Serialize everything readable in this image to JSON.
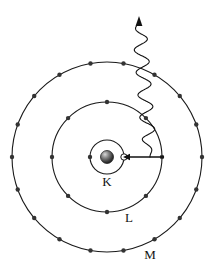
{
  "figure": {
    "background_color": "#ffffff",
    "stroke_color": "#1a1a1a",
    "electron_color": "#333333",
    "width": 213,
    "height": 270
  },
  "atom": {
    "center": {
      "x": 107,
      "y": 157
    },
    "nucleus": {
      "label": "nucleus",
      "radius": 6.5,
      "fill_color": "#555555",
      "highlight_color": "#cccccc"
    },
    "vacancy": {
      "label": "hole",
      "radius": 3.2,
      "angle_deg": 0,
      "fill_color": "#ffffff",
      "stroke_color": "#1a1a1a"
    },
    "shells": [
      {
        "name": "K",
        "label": "K",
        "radius": 17,
        "electron_count": 1,
        "electron_angles_deg": [
          180
        ],
        "label_position": {
          "x": 107,
          "y": 186
        }
      },
      {
        "name": "L",
        "label": "L",
        "radius": 55,
        "electron_count": 8,
        "electron_angles_deg": [
          0,
          45,
          90,
          135,
          180,
          225,
          270,
          315
        ],
        "label_position": {
          "x": 129,
          "y": 222
        }
      },
      {
        "name": "M",
        "label": "M",
        "radius": 95,
        "electron_count": 18,
        "electron_angles_deg": [
          0,
          20,
          40,
          60,
          80,
          100,
          120,
          140,
          160,
          180,
          200,
          220,
          240,
          260,
          280,
          300,
          320,
          340
        ],
        "label_position": {
          "x": 150,
          "y": 259
        }
      }
    ],
    "electron_dot_radius": 2.2
  },
  "transition_arrow": {
    "label": "electron-transition-L-to-K",
    "from": {
      "x": 164,
      "y": 157
    },
    "to": {
      "x": 123,
      "y": 157
    },
    "head_size": 6
  },
  "photon_wave": {
    "label": "emitted-x-ray-photon",
    "start": {
      "x": 150,
      "y": 157
    },
    "end": {
      "x": 139,
      "y": 22
    },
    "amplitude": 7,
    "cycles": 6,
    "arrowhead": {
      "x": 139,
      "y": 16,
      "size": 7
    }
  }
}
